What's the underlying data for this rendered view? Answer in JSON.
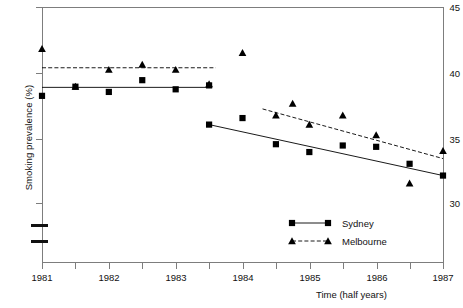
{
  "chart_data": {
    "type": "scatter",
    "title": "",
    "xlabel": "Time (half years)",
    "ylabel": "Smoking prevalence (%)",
    "xlim": [
      1981,
      1987
    ],
    "ylim": [
      29.0,
      45
    ],
    "grid": false,
    "axis_break": true,
    "legend_position": "bottom-right",
    "x_tick_labels": [
      "1981",
      "1982",
      "1983",
      "1984",
      "1985",
      "1986",
      "1987"
    ],
    "x_minor_ticks": [
      1981.5,
      1982.5,
      1983.5,
      1984.5,
      1985.5,
      1986.5
    ],
    "y_tick_labels": [
      "30",
      "35",
      "40",
      "45"
    ],
    "y_ticks": [
      30,
      35,
      40,
      45
    ],
    "series": [
      {
        "name": "Sydney",
        "marker": "square",
        "line": "solid",
        "x": [
          1981,
          1981.5,
          1982,
          1982.5,
          1983,
          1983.5,
          1983.5,
          1984,
          1984.5,
          1985,
          1985.5,
          1986,
          1986.5,
          1987
        ],
        "values": [
          38.2,
          38.9,
          38.5,
          39.4,
          38.7,
          39.0,
          36.0,
          36.5,
          34.5,
          33.9,
          34.4,
          34.3,
          33.0,
          32.1
        ],
        "trend_segments": [
          {
            "x1": 1981,
            "y1": 38.85,
            "x2": 1983.5,
            "y2": 38.85
          },
          {
            "x1": 1983.5,
            "y1": 36.0,
            "x2": 1987,
            "y2": 32.1
          }
        ]
      },
      {
        "name": "Melbourne",
        "marker": "triangle",
        "line": "dashed",
        "x": [
          1981,
          1981.5,
          1982,
          1982.5,
          1983,
          1983.5,
          1984,
          1984.5,
          1984.75,
          1985,
          1985.5,
          1986,
          1986.5,
          1987
        ],
        "values": [
          41.8,
          38.9,
          40.2,
          40.6,
          40.2,
          39.1,
          41.5,
          36.7,
          37.6,
          36.0,
          36.7,
          35.2,
          31.5,
          34.0
        ],
        "trend_segments": [
          {
            "x1": 1981,
            "y1": 40.35,
            "x2": 1983.6,
            "y2": 40.35
          },
          {
            "x1": 1984.3,
            "y1": 37.2,
            "x2": 1987,
            "y2": 33.4
          }
        ]
      }
    ]
  },
  "axes": {
    "ylabel": "Smoking prevalence (%)",
    "xlabel": "Time (half years)",
    "y_labels": [
      "45",
      "40",
      "35",
      "30"
    ],
    "x_labels": [
      "1981",
      "1982",
      "1983",
      "1984",
      "1985",
      "1986",
      "1987"
    ]
  },
  "legend": {
    "entries": [
      {
        "label": "Sydney",
        "marker": "square",
        "line": "solid"
      },
      {
        "label": "Melbourne",
        "marker": "triangle",
        "line": "dashed"
      }
    ]
  }
}
